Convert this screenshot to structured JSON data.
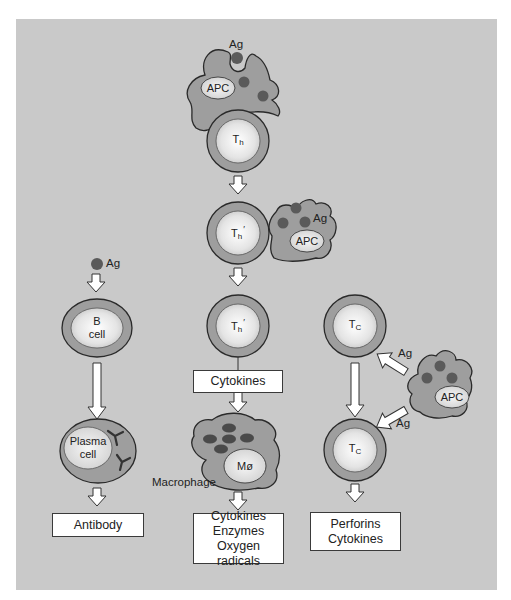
{
  "diagram": {
    "colors": {
      "background": "#c9c9c9",
      "cell_outer": "#9e9e9e",
      "cell_inner": "#e8e8e8",
      "antigen": "#5a5a5a",
      "outline": "#2a2a2a",
      "arrow_fill": "#ffffff",
      "box_fill": "#ffffff"
    },
    "center_column": {
      "top_apc": {
        "label": "APC",
        "antigen_label": "Ag"
      },
      "th_cell": {
        "label": "T",
        "sub": "h"
      },
      "th_prime_cell_1": {
        "label": "T",
        "sub": "h",
        "prime": "′"
      },
      "side_apc": {
        "label": "APC",
        "antigen_label": "Ag"
      },
      "th_prime_cell_2": {
        "label": "T",
        "sub": "h",
        "prime": "′"
      },
      "cytokines_box": {
        "text": "Cytokines"
      },
      "macrophage": {
        "label": "Mø",
        "caption": "Macrophage"
      },
      "output_box": {
        "lines": [
          "Cytokines",
          "Enzymes",
          "Oxygen radicals"
        ]
      }
    },
    "left_column": {
      "antigen_label": "Ag",
      "b_cell": {
        "line1": "B",
        "line2": "cell"
      },
      "plasma_cell": {
        "line1": "Plasma",
        "line2": "cell"
      },
      "output_box": {
        "text": "Antibody"
      }
    },
    "right_column": {
      "tc_cell_1": {
        "label": "T",
        "sub": "C"
      },
      "tc_cell_2": {
        "label": "T",
        "sub": "C"
      },
      "apc": {
        "label": "APC"
      },
      "antigen_label_upper": "Ag",
      "antigen_label_lower": "Ag",
      "output_box": {
        "lines": [
          "Perforins",
          "Cytokines"
        ]
      }
    }
  }
}
